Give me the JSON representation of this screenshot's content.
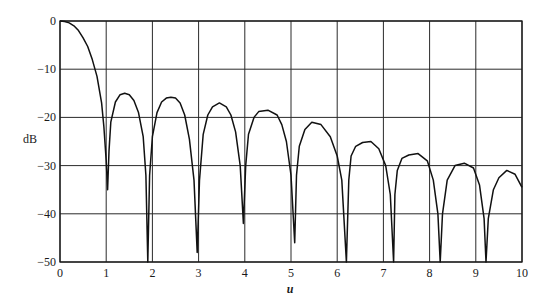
{
  "chart_data": {
    "type": "line",
    "title": "",
    "xlabel": "u",
    "ylabel": "dB",
    "xlim": [
      0,
      10
    ],
    "ylim": [
      -50,
      0
    ],
    "grid": true,
    "legend": null,
    "x_ticks": [
      "0",
      "1",
      "2",
      "3",
      "4",
      "5",
      "6",
      "7",
      "8",
      "9",
      "10"
    ],
    "y_ticks": [
      "0",
      "-10",
      "-20",
      "-30",
      "-40",
      "-50"
    ],
    "series": [
      {
        "name": "pattern",
        "x": [
          0,
          0.1,
          0.2,
          0.3,
          0.4,
          0.5,
          0.6,
          0.7,
          0.8,
          0.9,
          0.95,
          1.0,
          1.03,
          1.06,
          1.1,
          1.2,
          1.3,
          1.4,
          1.5,
          1.6,
          1.7,
          1.8,
          1.86,
          1.9,
          1.94,
          2.0,
          2.1,
          2.2,
          2.3,
          2.4,
          2.5,
          2.6,
          2.7,
          2.8,
          2.9,
          2.97,
          3.02,
          3.1,
          3.2,
          3.3,
          3.45,
          3.6,
          3.7,
          3.8,
          3.9,
          3.97,
          4.02,
          4.08,
          4.2,
          4.3,
          4.5,
          4.7,
          4.8,
          4.9,
          5.0,
          5.08,
          5.12,
          5.18,
          5.3,
          5.45,
          5.65,
          5.85,
          6.0,
          6.1,
          6.2,
          6.25,
          6.3,
          6.4,
          6.55,
          6.73,
          6.9,
          7.05,
          7.15,
          7.22,
          7.25,
          7.3,
          7.4,
          7.55,
          7.75,
          7.95,
          8.08,
          8.18,
          8.23,
          8.28,
          8.38,
          8.55,
          8.75,
          8.95,
          9.08,
          9.18,
          9.22,
          9.27,
          9.38,
          9.5,
          9.67,
          9.85,
          10.0
        ],
        "values": [
          0,
          -0.1,
          -0.4,
          -1.0,
          -2.0,
          -3.5,
          -5.3,
          -8.0,
          -11.5,
          -17.0,
          -22.0,
          -29.0,
          -35.0,
          -27.0,
          -21.0,
          -16.8,
          -15.3,
          -15.0,
          -15.3,
          -16.5,
          -19.0,
          -24.0,
          -32.0,
          -50.0,
          -32.0,
          -24.0,
          -19.0,
          -16.8,
          -16.0,
          -15.8,
          -16.0,
          -17.0,
          -19.5,
          -24.5,
          -33.0,
          -48.0,
          -33.0,
          -23.5,
          -19.5,
          -17.8,
          -17.0,
          -17.8,
          -19.5,
          -23.0,
          -30.0,
          -42.0,
          -30.0,
          -23.5,
          -20.0,
          -18.8,
          -18.5,
          -19.5,
          -21.5,
          -25.0,
          -32.0,
          -46.0,
          -32.0,
          -26.0,
          -22.5,
          -21.0,
          -21.5,
          -24.0,
          -28.0,
          -33.0,
          -50.0,
          -33.0,
          -28.0,
          -26.0,
          -25.2,
          -25.0,
          -26.5,
          -30.0,
          -36.0,
          -50.0,
          -36.0,
          -31.0,
          -28.5,
          -27.8,
          -27.5,
          -29.0,
          -33.0,
          -40.0,
          -50.0,
          -40.0,
          -33.0,
          -30.0,
          -29.5,
          -30.5,
          -34.0,
          -41.0,
          -50.0,
          -41.0,
          -35.0,
          -32.5,
          -31.0,
          -31.8,
          -34.5
        ]
      }
    ],
    "nulls": [
      {
        "u": 1.03,
        "dB": -35
      },
      {
        "u": 1.9,
        "dB": -50
      },
      {
        "u": 2.97,
        "dB": -48
      },
      {
        "u": 4.02,
        "dB": -42
      },
      {
        "u": 5.12,
        "dB": -46
      },
      {
        "u": 6.25,
        "dB": -50
      },
      {
        "u": 7.25,
        "dB": -50
      },
      {
        "u": 8.23,
        "dB": -50
      },
      {
        "u": 9.22,
        "dB": -50
      }
    ],
    "sidelobe_peaks": [
      {
        "u": 1.4,
        "dB": -15.0
      },
      {
        "u": 2.4,
        "dB": -15.8
      },
      {
        "u": 3.45,
        "dB": -17.0
      },
      {
        "u": 4.5,
        "dB": -18.5
      },
      {
        "u": 5.65,
        "dB": -21.0
      },
      {
        "u": 6.73,
        "dB": -25.0
      },
      {
        "u": 7.75,
        "dB": -27.5
      },
      {
        "u": 8.75,
        "dB": -29.5
      },
      {
        "u": 9.67,
        "dB": -31.0
      }
    ]
  }
}
